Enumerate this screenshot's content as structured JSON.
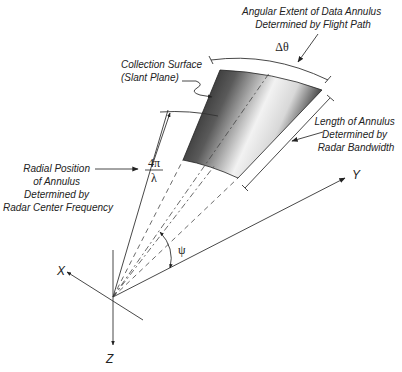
{
  "diagram": {
    "labels": {
      "angular_extent": [
        "Angular Extent of Data Annulus",
        "Determined by Flight Path"
      ],
      "collection_surface": [
        "Collection Surface",
        "(Slant Plane)"
      ],
      "length_annulus": [
        "Length of Annulus",
        "Determined by",
        "Radar Bandwidth"
      ],
      "radial_position": [
        "Radial Position",
        "of Annulus",
        "Determined by",
        "Radar Center Frequency"
      ]
    },
    "symbols": {
      "delta_theta": "Δθ",
      "four_pi": "4π",
      "lambda": "λ",
      "psi": "ψ"
    },
    "axes": {
      "x": "X",
      "y": "Y",
      "z": "Z"
    },
    "colors": {
      "line": "#333333",
      "surface_dark": "#111111",
      "surface_light": "#f4f4f4"
    }
  }
}
